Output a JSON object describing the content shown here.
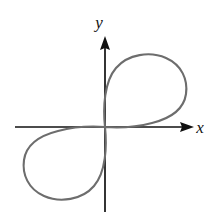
{
  "figure": {
    "background_color": "#ffffff",
    "width": 218,
    "height": 222
  },
  "axes": {
    "x_axis": {
      "label": "x",
      "color": "#111111",
      "label_x": 200,
      "label_y": 133,
      "start_x": 15,
      "end_x": 194,
      "y": 127,
      "arrow": "right-arrowhead"
    },
    "y_axis": {
      "label": "y",
      "color": "#111111",
      "label_x": 99,
      "label_y": 28,
      "start_y": 212,
      "end_y": 36,
      "x": 105,
      "arrow": "up-arrowhead"
    },
    "origin": {
      "x": 105,
      "y": 127
    }
  },
  "curve": {
    "name": "two-lobed-curve",
    "color": "#6d6d6d",
    "stroke_width": 2.1,
    "description": "Closed curve with one lobe in the first quadrant and a congruent lobe, rotated 180 degrees, in the third quadrant; both lobes meet tangentially at the origin.",
    "upper_lobe": {
      "quadrant": "I",
      "rightmost_x": 186,
      "topmost_y": 55,
      "apex_x": 146
    },
    "lower_lobe": {
      "quadrant": "III",
      "leftmost_x": 23,
      "bottommost_y": 198,
      "apex_x": 64
    },
    "path": "M 105 127 C 103 108 104 82 116 68 C 128 54 150 51 166 58 C 182 65 188 80 186 94 C 184 108 172 118 152 123 C 133 128 118 128 105 127 C 107 146 106 172 94 186 C 82 200 60 203 44 196 C 28 189 22 174 24 160 C 26 146 38 136 58 131 C 77 126 92 126 105 127 Z"
  },
  "chart_data": {
    "type": "line",
    "title": "",
    "xlabel": "x",
    "ylabel": "y",
    "grid": false,
    "legend": null,
    "series": [
      {
        "name": "two-lobed-curve",
        "closed": true,
        "color": "#6d6d6d",
        "points_note": "Drawn as a smooth closed parametric curve; lobes are point-symmetric about the origin."
      }
    ]
  }
}
